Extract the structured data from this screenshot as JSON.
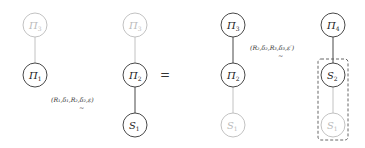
{
  "diagram": {
    "equals": "=",
    "left": {
      "columns": [
        {
          "nodes": [
            {
              "symbol": "Π",
              "sub": "3",
              "style": "light"
            },
            {
              "symbol": "Π",
              "sub": "1",
              "style": "dark"
            }
          ]
        },
        {
          "nodes": [
            {
              "symbol": "Π",
              "sub": "3",
              "style": "light"
            },
            {
              "symbol": "Π",
              "sub": "2",
              "style": "dark"
            },
            {
              "symbol": "S",
              "sub": "1",
              "style": "dark"
            }
          ]
        }
      ],
      "relation_label": "(R₁,δ₁,R₂,δ₂,ε)",
      "relation_tilde": "∼"
    },
    "right": {
      "columns": [
        {
          "nodes": [
            {
              "symbol": "Π",
              "sub": "3",
              "style": "dark"
            },
            {
              "symbol": "Π",
              "sub": "2",
              "style": "dark"
            },
            {
              "symbol": "S",
              "sub": "1",
              "style": "light"
            }
          ]
        },
        {
          "nodes": [
            {
              "symbol": "Π",
              "sub": "4",
              "style": "dark"
            },
            {
              "symbol": "S",
              "sub": "2",
              "style": "dark"
            },
            {
              "symbol": "S",
              "sub": "1",
              "style": "light"
            }
          ],
          "highlight_box": "dashed"
        }
      ],
      "relation_label": "(R₂,δ₂,R₃,δ₃,ε′)",
      "relation_tilde": "∼"
    }
  }
}
